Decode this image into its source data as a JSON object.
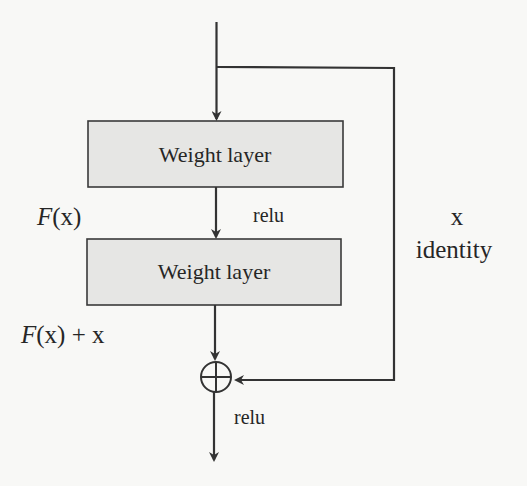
{
  "diagram": {
    "blocks": [
      {
        "label": "Weight layer"
      },
      {
        "label": "Weight layer"
      }
    ],
    "labels": {
      "fx_func": "F",
      "fx_arg": "(x)",
      "relu_mid": "relu",
      "skip_x": "x",
      "skip_identity": "identity",
      "sum_func": "F",
      "sum_rest": "(x) + x",
      "relu_out": "relu"
    },
    "sum_node": {
      "symbol": "⊕",
      "name": "addition"
    },
    "colors": {
      "line": "#333333",
      "box_fill": "#e6e6e4",
      "box_stroke": "#3a3a3a",
      "text": "#262626",
      "background": "#f8f8f6"
    }
  }
}
